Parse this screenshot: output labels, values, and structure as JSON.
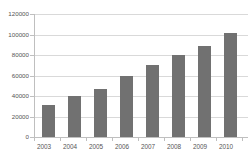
{
  "chart_data": {
    "type": "bar",
    "title": "",
    "xlabel": "",
    "ylabel": "",
    "categories": [
      "2003",
      "2004",
      "2005",
      "2006",
      "2007",
      "2008",
      "2009",
      "2010"
    ],
    "values": [
      31000,
      40000,
      47000,
      60000,
      70000,
      80000,
      89000,
      101000
    ],
    "ylim": [
      0,
      120000
    ],
    "ytick_labels": [
      "0",
      "20000",
      "40000",
      "60000",
      "80000",
      "100000",
      "120000"
    ],
    "ytick_values": [
      0,
      20000,
      40000,
      60000,
      80000,
      100000,
      120000
    ],
    "grid": true,
    "legend": false,
    "bar_color": "#717171",
    "grid_color": "#d9d9d9",
    "axis_color": "#bfbfbf",
    "text_color": "#555555"
  }
}
